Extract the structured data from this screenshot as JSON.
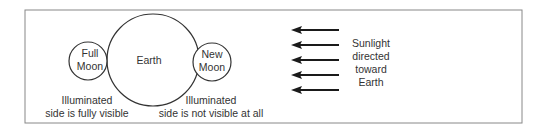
{
  "diagram": {
    "earth_label": "Earth",
    "full_moon_label": [
      "Full",
      "Moon"
    ],
    "new_moon_label": [
      "New",
      "Moon"
    ],
    "full_moon_caption": [
      "Illuminated",
      "side is fully visible"
    ],
    "new_moon_caption": [
      "Illuminated",
      "side is not visible at all"
    ],
    "sunlight_label": [
      "Sunlight",
      "directed",
      "toward",
      "Earth"
    ],
    "arrow_count": 5,
    "arrow_direction": "left",
    "colors": {
      "stroke": "#333333",
      "border": "#888888",
      "arrow": "#1a1a1a"
    }
  }
}
